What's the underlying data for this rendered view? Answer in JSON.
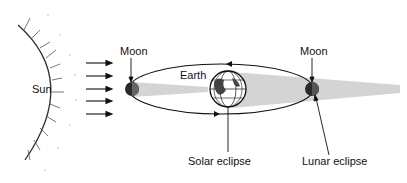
{
  "diagram": {
    "labels": {
      "sun": "Sun",
      "moon_left": "Moon",
      "moon_right": "Moon",
      "earth": "Earth",
      "solar_eclipse": "Solar eclipse",
      "lunar_eclipse": "Lunar eclipse"
    },
    "colors": {
      "shadow": "#d4d4d4",
      "line": "#111111",
      "moon": "#2a2a2a"
    },
    "sunlight_arrow_count": 5
  }
}
